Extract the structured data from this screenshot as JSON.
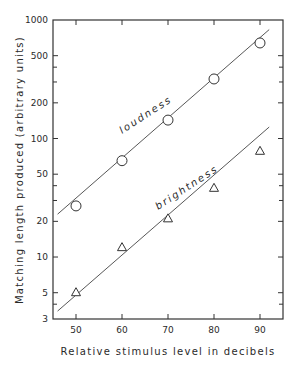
{
  "chart_data": {
    "type": "scatter",
    "title": "",
    "xlabel": "Relative stimulus level in decibels",
    "ylabel": "Matching length produced (arbitrary units)",
    "xlim": [
      45,
      95
    ],
    "ylim": [
      3,
      1000
    ],
    "yscale": "log",
    "grid": false,
    "legend": "none (series labeled inline)",
    "x_ticks": [
      50,
      60,
      70,
      80,
      90
    ],
    "y_ticks": [
      1000,
      500,
      200,
      100,
      50,
      20,
      10,
      5,
      3
    ],
    "y_minor_ticks": [
      400,
      300,
      40,
      30,
      4
    ],
    "x": [
      50,
      60,
      70,
      80,
      90
    ],
    "series": [
      {
        "name": "loudness",
        "marker": "circle",
        "values": [
          27,
          65,
          143,
          318,
          640
        ],
        "fit_line": {
          "x": [
            46,
            92
          ],
          "y": [
            23,
            830
          ]
        }
      },
      {
        "name": "brightness",
        "marker": "triangle",
        "values": [
          5,
          12,
          21,
          38,
          78
        ],
        "fit_line": {
          "x": [
            46,
            92
          ],
          "y": [
            3.5,
            125
          ]
        }
      }
    ],
    "annotations": [
      {
        "text": "loudness",
        "near_series": "loudness"
      },
      {
        "text": "brightness",
        "near_series": "brightness"
      }
    ]
  },
  "labels": {
    "x_axis": "Relative stimulus level in decibels",
    "y_axis": "Matching length produced  (arbitrary  units)",
    "loudness": "loudness",
    "brightness": "brightness",
    "x_ticks": [
      "50",
      "60",
      "70",
      "80",
      "90"
    ],
    "y_ticks": [
      "1000",
      "500",
      "200",
      "100",
      "50",
      "20",
      "10",
      "5",
      "3"
    ]
  }
}
